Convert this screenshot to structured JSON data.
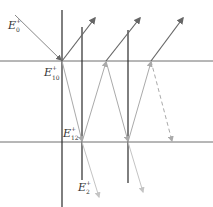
{
  "diagram": {
    "labels": {
      "incident": {
        "base": "E",
        "sup": "+",
        "sub": "0"
      },
      "first_interface": {
        "base": "E",
        "sup": "+",
        "sub": "10"
      },
      "second_interface": {
        "base": "E",
        "sup": "+",
        "sub": "12"
      },
      "transmitted": {
        "base": "E",
        "sup": "+",
        "sub": "2"
      }
    },
    "colors": {
      "interface_line": "#6e6e6e",
      "normal_line": "#2b2b2b",
      "incident_ray": "#888888",
      "reflected_ray": "#666666",
      "internal_ray": "#aaaaaa",
      "transmitted_ray": "#c4c4c4"
    },
    "interfaces_y": [
      61,
      142
    ],
    "normals_x": [
      62,
      82,
      128
    ],
    "dashed_last_segment": true
  }
}
